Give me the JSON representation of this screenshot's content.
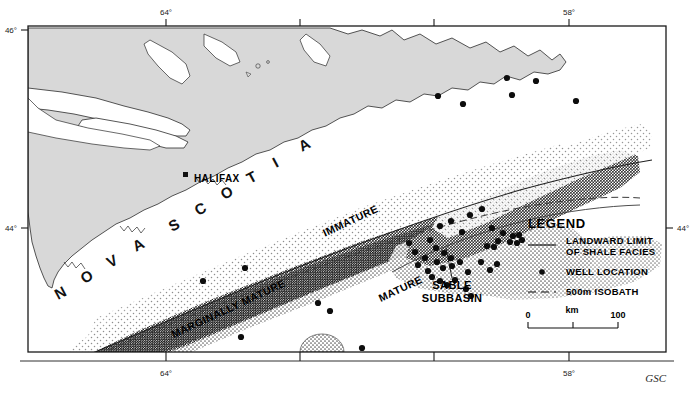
{
  "figure": {
    "credit": "GSC",
    "frame": {
      "x": 28,
      "y": 26,
      "width": 638,
      "height": 326
    }
  },
  "axes": {
    "top_ticks": [
      {
        "label": "64°",
        "x": 166
      },
      {
        "label": "",
        "x": 300
      },
      {
        "label": "",
        "x": 434
      },
      {
        "label": "58°",
        "x": 569
      }
    ],
    "bottom_ticks": [
      {
        "label": "64°",
        "x": 166
      },
      {
        "label": "",
        "x": 300
      },
      {
        "label": "",
        "x": 434
      },
      {
        "label": "58°",
        "x": 569
      }
    ],
    "left_ticks": [
      {
        "label": "46°",
        "y": 30
      },
      {
        "label": "44°",
        "y": 228
      }
    ],
    "right_ticks": [
      {
        "label": "44°",
        "y": 228
      }
    ]
  },
  "map_labels": {
    "province": "NOVA SCOTIA",
    "province_letters": [
      "N",
      "O",
      "V",
      "A",
      "S",
      "C",
      "O",
      "T",
      "I",
      "A"
    ],
    "city": "HALIFAX",
    "facies": [
      {
        "name": "IMMATURE",
        "x": 352,
        "y": 224,
        "rotation": -25
      },
      {
        "name": "MARGINALLY MATURE",
        "x": 230,
        "y": 312,
        "rotation": -25
      },
      {
        "name": "MATURE",
        "x": 402,
        "y": 292,
        "rotation": -25
      }
    ],
    "basin": {
      "line1": "SABLE",
      "line2": "SUBBASIN",
      "x": 452,
      "y": 289
    }
  },
  "legend": {
    "title": "LEGEND",
    "items": [
      {
        "symbol": "solid-line",
        "label_line1": "LANDWARD LIMIT",
        "label_line2": "OF SHALE FACIES"
      },
      {
        "symbol": "filled-dot",
        "label_line1": "WELL LOCATION",
        "label_line2": ""
      },
      {
        "symbol": "dashed-line",
        "label_line1": "500m ISOBATH",
        "label_line2": ""
      }
    ],
    "scale": {
      "min": "0",
      "max": "100",
      "unit": "km"
    }
  },
  "colors": {
    "land": "#d8d8d8",
    "land_stroke": "#2b2b2b",
    "frame": "#1a1a1a",
    "stipple_light": "#9a9a9a",
    "stipple_medium": "#4a4a4a",
    "stipple_dark": "#1a1a1a",
    "well_dot": "#0d0d0d",
    "background": "#ffffff"
  },
  "wells": {
    "count": 47,
    "points": [
      [
        438,
        96
      ],
      [
        463,
        104
      ],
      [
        507,
        78
      ],
      [
        512,
        95
      ],
      [
        536,
        81
      ],
      [
        576,
        101
      ],
      [
        440,
        226
      ],
      [
        451,
        221
      ],
      [
        462,
        232
      ],
      [
        470,
        215
      ],
      [
        482,
        209
      ],
      [
        492,
        228
      ],
      [
        498,
        241
      ],
      [
        487,
        246
      ],
      [
        494,
        247
      ],
      [
        503,
        233
      ],
      [
        510,
        242
      ],
      [
        513,
        236
      ],
      [
        517,
        243
      ],
      [
        519,
        235
      ],
      [
        522,
        240
      ],
      [
        430,
        240
      ],
      [
        436,
        248
      ],
      [
        444,
        253
      ],
      [
        451,
        258
      ],
      [
        437,
        262
      ],
      [
        443,
        268
      ],
      [
        452,
        266
      ],
      [
        460,
        262
      ],
      [
        468,
        272
      ],
      [
        425,
        258
      ],
      [
        428,
        271
      ],
      [
        432,
        277
      ],
      [
        440,
        281
      ],
      [
        447,
        285
      ],
      [
        455,
        280
      ],
      [
        415,
        252
      ],
      [
        418,
        265
      ],
      [
        409,
        243
      ],
      [
        481,
        262
      ],
      [
        490,
        270
      ],
      [
        497,
        264
      ],
      [
        466,
        289
      ],
      [
        471,
        296
      ],
      [
        245,
        268
      ],
      [
        203,
        281
      ],
      [
        318,
        303
      ],
      [
        330,
        311
      ],
      [
        241,
        337
      ],
      [
        362,
        348
      ]
    ]
  }
}
